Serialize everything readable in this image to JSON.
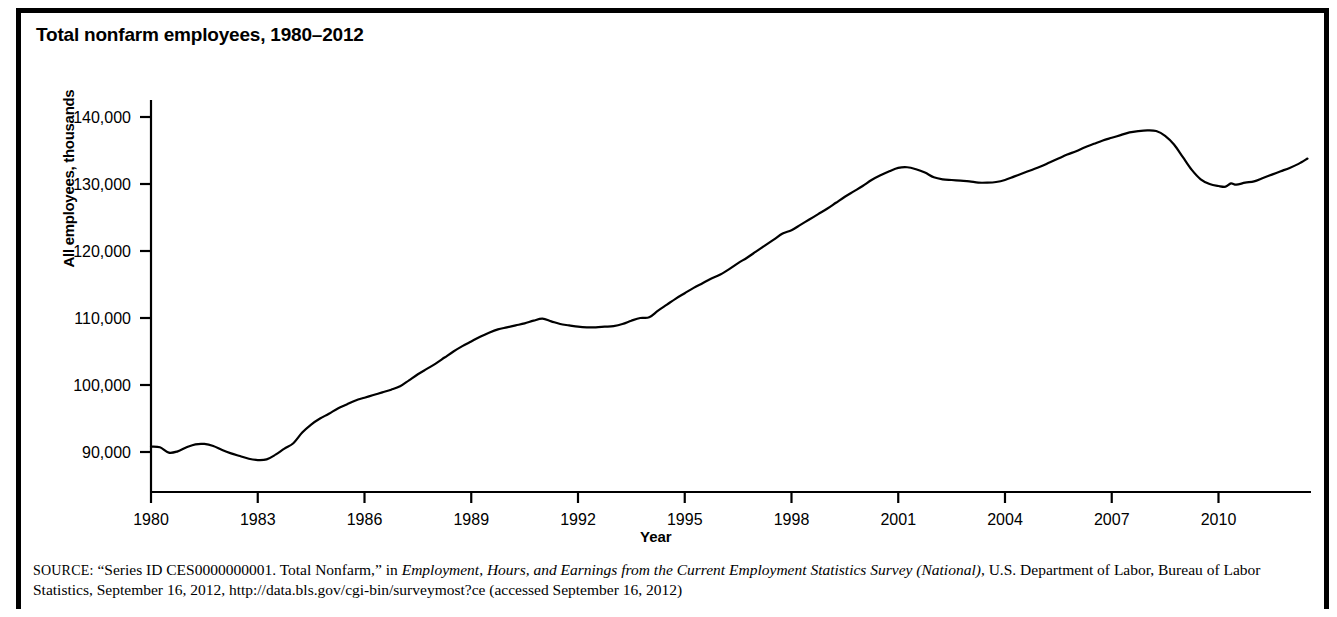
{
  "figure": {
    "title": "Total nonfarm employees, 1980–2012"
  },
  "source": {
    "label": "SOURCE:",
    "text_part1": " “Series ID CES0000000001. Total Nonfarm,” in ",
    "italic1": "Employment, Hours, and Earnings from the Current Employment Statistics Survey (National)",
    "text_part2": ", U.S. Department of Labor, Bureau of Labor Statistics, September 16, 2012, http://data.bls.gov/cgi-bin/surveymost?ce (accessed September 16, 2012)"
  },
  "chart_data": {
    "type": "line",
    "title": "Total nonfarm employees, 1980–2012",
    "xlabel": "Year",
    "ylabel": "All employees, thousands",
    "xlim": [
      1980,
      2012.6
    ],
    "ylim": [
      85000,
      142000
    ],
    "grid": false,
    "legend": false,
    "y_ticks": [
      90000,
      100000,
      110000,
      120000,
      130000,
      140000
    ],
    "y_tick_labels": [
      "90,000",
      "100,000",
      "110,000",
      "120,000",
      "130,000",
      "140,000"
    ],
    "x_ticks": [
      1980,
      1983,
      1986,
      1989,
      1992,
      1995,
      1998,
      2001,
      2004,
      2007,
      2010
    ],
    "x_tick_labels": [
      "1980",
      "1983",
      "1986",
      "1989",
      "1992",
      "1995",
      "1998",
      "2001",
      "2004",
      "2007",
      "2010"
    ],
    "series": [
      {
        "name": "Total nonfarm employees",
        "color": "#000000",
        "x": [
          1980.0,
          1980.25,
          1980.5,
          1980.75,
          1981.0,
          1981.25,
          1981.5,
          1981.75,
          1982.0,
          1982.25,
          1982.5,
          1982.75,
          1983.0,
          1983.25,
          1983.5,
          1983.75,
          1984.0,
          1984.25,
          1984.5,
          1984.75,
          1985.0,
          1985.25,
          1985.5,
          1985.75,
          1986.0,
          1986.25,
          1986.5,
          1986.75,
          1987.0,
          1987.25,
          1987.5,
          1987.75,
          1988.0,
          1988.25,
          1988.5,
          1988.75,
          1989.0,
          1989.25,
          1989.5,
          1989.75,
          1990.0,
          1990.25,
          1990.5,
          1990.75,
          1991.0,
          1991.25,
          1991.5,
          1991.75,
          1992.0,
          1992.25,
          1992.5,
          1992.75,
          1993.0,
          1993.25,
          1993.5,
          1993.75,
          1994.0,
          1994.25,
          1994.5,
          1994.75,
          1995.0,
          1995.25,
          1995.5,
          1995.75,
          1996.0,
          1996.25,
          1996.5,
          1996.75,
          1997.0,
          1997.25,
          1997.5,
          1997.75,
          1998.0,
          1998.25,
          1998.5,
          1998.75,
          1999.0,
          1999.25,
          1999.5,
          1999.75,
          2000.0,
          2000.25,
          2000.5,
          2000.75,
          2001.0,
          2001.25,
          2001.5,
          2001.75,
          2002.0,
          2002.25,
          2002.5,
          2002.75,
          2003.0,
          2003.25,
          2003.5,
          2003.75,
          2004.0,
          2004.25,
          2004.5,
          2004.75,
          2005.0,
          2005.25,
          2005.5,
          2005.75,
          2006.0,
          2006.25,
          2006.5,
          2006.75,
          2007.0,
          2007.25,
          2007.5,
          2007.75,
          2008.0,
          2008.25,
          2008.5,
          2008.75,
          2009.0,
          2009.25,
          2009.5,
          2009.75,
          2010.0,
          2010.2,
          2010.35,
          2010.5,
          2010.75,
          2011.0,
          2011.25,
          2011.5,
          2011.75,
          2012.0,
          2012.25,
          2012.5
        ],
        "y": [
          90800,
          90700,
          89900,
          90100,
          90700,
          91150,
          91200,
          90900,
          90300,
          89800,
          89400,
          89000,
          88800,
          88900,
          89600,
          90500,
          91300,
          92900,
          94100,
          95000,
          95700,
          96500,
          97100,
          97700,
          98100,
          98500,
          98900,
          99300,
          99800,
          100700,
          101600,
          102400,
          103200,
          104100,
          105000,
          105800,
          106500,
          107200,
          107800,
          108300,
          108600,
          108900,
          109200,
          109600,
          109900,
          109500,
          109100,
          108900,
          108700,
          108600,
          108600,
          108700,
          108800,
          109100,
          109600,
          110000,
          110100,
          111100,
          112000,
          112900,
          113700,
          114500,
          115200,
          115900,
          116500,
          117300,
          118200,
          119000,
          119900,
          120800,
          121700,
          122600,
          123100,
          123900,
          124700,
          125500,
          126300,
          127200,
          128100,
          128900,
          129700,
          130600,
          131300,
          131900,
          132400,
          132500,
          132200,
          131700,
          131000,
          130700,
          130600,
          130500,
          130400,
          130200,
          130200,
          130300,
          130600,
          131100,
          131600,
          132100,
          132600,
          133200,
          133800,
          134400,
          134900,
          135500,
          136000,
          136500,
          136900,
          137300,
          137700,
          137900,
          138000,
          137900,
          137200,
          135900,
          134000,
          132100,
          130700,
          130000,
          129700,
          129600,
          130100,
          129900,
          130200,
          130400,
          130900,
          131400,
          131900,
          132400,
          133000,
          133800
        ]
      }
    ],
    "annotations": [
      {
        "label": "1981 local peak",
        "x": 1981.5,
        "y": 91200
      },
      {
        "label": "1983 recession trough",
        "x": 1983.0,
        "y": 88800
      },
      {
        "label": "1990-91 plateau",
        "x": 1992.25,
        "y": 108600
      },
      {
        "label": "2001 dot-com peak",
        "x": 2001.25,
        "y": 132500
      },
      {
        "label": "2003 trough",
        "x": 2003.25,
        "y": 130200
      },
      {
        "label": "2008 all-time peak",
        "x": 2008.0,
        "y": 138000
      },
      {
        "label": "2010 great recession trough",
        "x": 2010.0,
        "y": 129700
      },
      {
        "label": "2012 latest",
        "x": 2012.5,
        "y": 133800
      }
    ]
  }
}
